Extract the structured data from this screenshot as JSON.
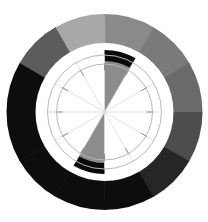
{
  "title": {
    "text": ""
  },
  "wheel": {
    "center": [
      104.5,
      112
    ],
    "outer_ring": {
      "outer_radius": 98,
      "inner_radius": 69,
      "segments": [
        {
          "start_deg": 0,
          "end_deg": 30,
          "color": "#8a8a8a"
        },
        {
          "start_deg": 30,
          "end_deg": 60,
          "color": "#7a7a7a"
        },
        {
          "start_deg": 60,
          "end_deg": 90,
          "color": "#6a6a6a"
        },
        {
          "start_deg": 90,
          "end_deg": 120,
          "color": "#4e4e4e"
        },
        {
          "start_deg": 120,
          "end_deg": 150,
          "color": "#262626"
        },
        {
          "start_deg": 150,
          "end_deg": 180,
          "color": "#111111"
        },
        {
          "start_deg": 180,
          "end_deg": 210,
          "color": "#0a0a0a"
        },
        {
          "start_deg": 210,
          "end_deg": 240,
          "color": "#0a0a0a"
        },
        {
          "start_deg": 240,
          "end_deg": 270,
          "color": "#0c0c0c"
        },
        {
          "start_deg": 270,
          "end_deg": 300,
          "color": "#0e0e0e"
        },
        {
          "start_deg": 300,
          "end_deg": 330,
          "color": "#5c5c5c"
        },
        {
          "start_deg": 330,
          "end_deg": 360,
          "color": "#a8a8a8"
        }
      ]
    },
    "inner": {
      "ring_radii": [
        48,
        57
      ],
      "spoke_count": 12,
      "highlight_wedges": [
        {
          "start_deg": 0,
          "end_deg": 30,
          "fill": "#8c8c8c",
          "arc_color": "#0a0a0a"
        },
        {
          "start_deg": 180,
          "end_deg": 210,
          "fill": "#8c8c8c",
          "arc_color": "#0a0a0a"
        }
      ],
      "tick_color": "#8a8a8a",
      "spoke_color": "#dcdcdc"
    }
  }
}
